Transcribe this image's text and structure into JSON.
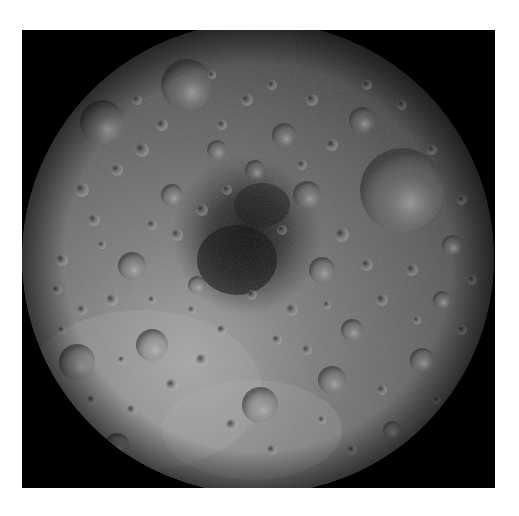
{
  "image": {
    "subject": "Lunar north pole mosaic",
    "description": "Grayscale cratered moon surface disc on black square background",
    "colors": {
      "background": "#ffffff",
      "frame": "#000000",
      "surface_light": "#9a9a9a",
      "surface_mid": "#6e6e6e",
      "surface_dark": "#3a3a3a",
      "pole_shadow": "#141414"
    },
    "disc": {
      "cx": 236,
      "cy": 228,
      "r": 236
    }
  }
}
